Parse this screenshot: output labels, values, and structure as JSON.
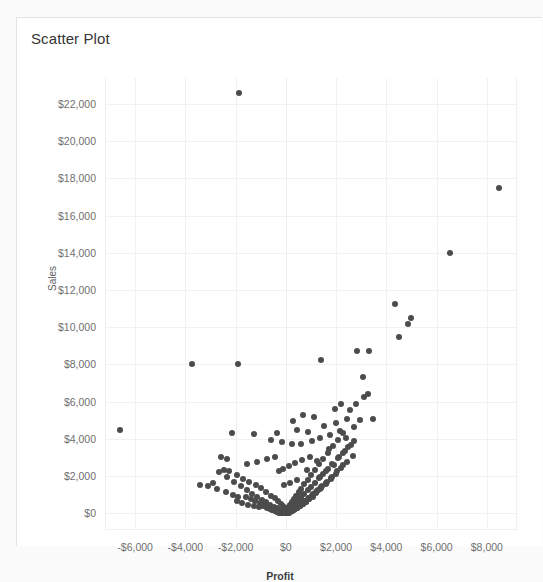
{
  "page": {
    "background_color": "#fbfbfb",
    "ghost_header_text": ""
  },
  "card": {
    "title": "Scatter Plot",
    "background_color": "#ffffff",
    "border_color": "#e4e4e4"
  },
  "chart_data": {
    "type": "scatter",
    "title": "Scatter Plot",
    "xlabel": "Profit",
    "ylabel": "Sales",
    "xlim": [
      -7200,
      9200
    ],
    "ylim": [
      -900,
      23400
    ],
    "xticks": [
      -6000,
      -4000,
      -2000,
      0,
      2000,
      4000,
      6000,
      8000
    ],
    "xticklabels": [
      "-$6,000",
      "-$4,000",
      "-$2,000",
      "$0",
      "$2,000",
      "$4,000",
      "$6,000",
      "$8,000"
    ],
    "yticks": [
      0,
      2000,
      4000,
      6000,
      8000,
      10000,
      12000,
      14000,
      16000,
      18000,
      20000,
      22000
    ],
    "yticklabels": [
      "$0",
      "$2,000",
      "$4,000",
      "$6,000",
      "$8,000",
      "$10,000",
      "$12,000",
      "$14,000",
      "$16,000",
      "$18,000",
      "$20,000",
      "$22,000"
    ],
    "grid": true,
    "legend": false,
    "marker_color": "#4c4c4c",
    "marker_size": 6,
    "series": [
      {
        "name": "Orders",
        "points": [
          [
            -1850,
            22600
          ],
          [
            8500,
            17500
          ],
          [
            6550,
            14000
          ],
          [
            4350,
            11250
          ],
          [
            4980,
            10500
          ],
          [
            4850,
            10150
          ],
          [
            4500,
            9450
          ],
          [
            3300,
            8750
          ],
          [
            2850,
            8700
          ],
          [
            1400,
            8250
          ],
          [
            -1900,
            8050
          ],
          [
            -3750,
            8000
          ],
          [
            3050,
            7300
          ],
          [
            3250,
            6400
          ],
          [
            2200,
            5850
          ],
          [
            1950,
            5600
          ],
          [
            700,
            5300
          ],
          [
            1100,
            5150
          ],
          [
            300,
            4950
          ],
          [
            -6600,
            4500
          ],
          [
            -2150,
            4300
          ],
          [
            -1250,
            4250
          ],
          [
            -350,
            4300
          ],
          [
            450,
            4500
          ],
          [
            900,
            4350
          ],
          [
            1500,
            4700
          ],
          [
            2000,
            4850
          ],
          [
            2450,
            5050
          ],
          [
            -600,
            3950
          ],
          [
            -150,
            3850
          ],
          [
            250,
            3700
          ],
          [
            600,
            3750
          ],
          [
            1050,
            3900
          ],
          [
            1350,
            4050
          ],
          [
            1750,
            4200
          ],
          [
            2150,
            4400
          ],
          [
            -2450,
            2350
          ],
          [
            -2250,
            2250
          ],
          [
            -2650,
            2200
          ],
          [
            -1950,
            2050
          ],
          [
            -1700,
            1850
          ],
          [
            -1450,
            1700
          ],
          [
            -1200,
            1500
          ],
          [
            -1000,
            1350
          ],
          [
            -800,
            1150
          ],
          [
            -600,
            950
          ],
          [
            -430,
            800
          ],
          [
            -300,
            650
          ],
          [
            -200,
            520
          ],
          [
            -120,
            400
          ],
          [
            -60,
            300
          ],
          [
            -20,
            200
          ],
          [
            0,
            120
          ],
          [
            20,
            180
          ],
          [
            60,
            260
          ],
          [
            110,
            360
          ],
          [
            170,
            470
          ],
          [
            240,
            600
          ],
          [
            320,
            760
          ],
          [
            410,
            930
          ],
          [
            510,
            1120
          ],
          [
            620,
            1330
          ],
          [
            740,
            1560
          ],
          [
            870,
            1800
          ],
          [
            1010,
            2060
          ],
          [
            1160,
            2340
          ],
          [
            1320,
            2630
          ],
          [
            1490,
            2940
          ],
          [
            1670,
            3260
          ],
          [
            1860,
            3600
          ],
          [
            2060,
            3950
          ],
          [
            2270,
            4320
          ],
          [
            -2350,
            1950
          ],
          [
            -2050,
            1700
          ],
          [
            -1800,
            1450
          ],
          [
            -1550,
            1250
          ],
          [
            -1350,
            1050
          ],
          [
            -1150,
            880
          ],
          [
            -950,
            720
          ],
          [
            -780,
            580
          ],
          [
            -620,
            460
          ],
          [
            -480,
            360
          ],
          [
            -360,
            270
          ],
          [
            -260,
            200
          ],
          [
            -180,
            140
          ],
          [
            -110,
            95
          ],
          [
            -55,
            60
          ],
          [
            -15,
            35
          ],
          [
            15,
            60
          ],
          [
            55,
            110
          ],
          [
            105,
            175
          ],
          [
            165,
            255
          ],
          [
            235,
            350
          ],
          [
            315,
            460
          ],
          [
            405,
            585
          ],
          [
            505,
            725
          ],
          [
            615,
            880
          ],
          [
            735,
            1050
          ],
          [
            865,
            1235
          ],
          [
            1005,
            1435
          ],
          [
            1155,
            1650
          ],
          [
            1315,
            1880
          ],
          [
            1485,
            2125
          ],
          [
            1665,
            2385
          ],
          [
            1855,
            2660
          ],
          [
            2055,
            2950
          ],
          [
            2265,
            3255
          ],
          [
            2485,
            3575
          ],
          [
            2715,
            3910
          ],
          [
            -1600,
            900
          ],
          [
            -1400,
            760
          ],
          [
            -1220,
            640
          ],
          [
            -1050,
            530
          ],
          [
            -890,
            435
          ],
          [
            -740,
            350
          ],
          [
            -600,
            275
          ],
          [
            -470,
            210
          ],
          [
            -350,
            155
          ],
          [
            -240,
            110
          ],
          [
            -140,
            75
          ],
          [
            -50,
            45
          ],
          [
            40,
            50
          ],
          [
            130,
            90
          ],
          [
            230,
            150
          ],
          [
            340,
            230
          ],
          [
            460,
            330
          ],
          [
            590,
            450
          ],
          [
            730,
            590
          ],
          [
            880,
            750
          ],
          [
            1040,
            930
          ],
          [
            1210,
            1130
          ],
          [
            1390,
            1350
          ],
          [
            1580,
            1590
          ],
          [
            1780,
            1850
          ],
          [
            1990,
            2130
          ],
          [
            2210,
            2430
          ],
          [
            2440,
            2750
          ],
          [
            2680,
            3090
          ],
          [
            -900,
            380
          ],
          [
            -760,
            300
          ],
          [
            -630,
            230
          ],
          [
            -510,
            170
          ],
          [
            -400,
            120
          ],
          [
            -300,
            80
          ],
          [
            -210,
            50
          ],
          [
            -130,
            30
          ],
          [
            -60,
            20
          ],
          [
            10,
            25
          ],
          [
            90,
            55
          ],
          [
            180,
            105
          ],
          [
            280,
            175
          ],
          [
            390,
            265
          ],
          [
            510,
            375
          ],
          [
            640,
            505
          ],
          [
            780,
            655
          ],
          [
            930,
            825
          ],
          [
            1090,
            1015
          ],
          [
            1260,
            1225
          ],
          [
            1440,
            1455
          ],
          [
            1630,
            1705
          ],
          [
            1830,
            1975
          ],
          [
            2040,
            2265
          ],
          [
            2260,
            2575
          ],
          [
            -540,
            155
          ],
          [
            -440,
            110
          ],
          [
            -350,
            75
          ],
          [
            -270,
            48
          ],
          [
            -195,
            28
          ],
          [
            -130,
            15
          ],
          [
            -70,
            8
          ],
          [
            -20,
            5
          ],
          [
            30,
            12
          ],
          [
            90,
            35
          ],
          [
            160,
            72
          ],
          [
            240,
            125
          ],
          [
            330,
            195
          ],
          [
            430,
            280
          ],
          [
            540,
            385
          ],
          [
            660,
            505
          ],
          [
            790,
            645
          ],
          [
            930,
            805
          ],
          [
            1080,
            980
          ],
          [
            1240,
            1175
          ],
          [
            1410,
            1390
          ],
          [
            1590,
            1620
          ],
          [
            1780,
            1870
          ],
          [
            -320,
            60
          ],
          [
            -255,
            40
          ],
          [
            -195,
            25
          ],
          [
            -140,
            14
          ],
          [
            -90,
            7
          ],
          [
            -45,
            3
          ],
          [
            5,
            4
          ],
          [
            50,
            15
          ],
          [
            105,
            40
          ],
          [
            170,
            80
          ],
          [
            245,
            135
          ],
          [
            330,
            205
          ],
          [
            425,
            290
          ],
          [
            530,
            390
          ],
          [
            645,
            505
          ],
          [
            770,
            635
          ],
          [
            905,
            780
          ],
          [
            1050,
            940
          ],
          [
            1205,
            1115
          ],
          [
            1370,
            1305
          ],
          [
            -180,
            22
          ],
          [
            -135,
            12
          ],
          [
            -95,
            6
          ],
          [
            -60,
            3
          ],
          [
            -28,
            1
          ],
          [
            0,
            2
          ],
          [
            35,
            10
          ],
          [
            80,
            28
          ],
          [
            135,
            58
          ],
          [
            200,
            100
          ],
          [
            275,
            155
          ],
          [
            360,
            222
          ],
          [
            455,
            302
          ],
          [
            560,
            395
          ],
          [
            675,
            500
          ],
          [
            800,
            618
          ],
          [
            935,
            748
          ],
          [
            1080,
            890
          ],
          [
            -95,
            8
          ],
          [
            -65,
            4
          ],
          [
            -38,
            2
          ],
          [
            -15,
            1
          ],
          [
            10,
            3
          ],
          [
            45,
            14
          ],
          [
            90,
            35
          ],
          [
            145,
            68
          ],
          [
            210,
            112
          ],
          [
            285,
            168
          ],
          [
            370,
            235
          ],
          [
            465,
            315
          ],
          [
            570,
            405
          ],
          [
            685,
            508
          ],
          [
            810,
            622
          ],
          [
            -2900,
            1650
          ],
          [
            -3100,
            1450
          ],
          [
            -2750,
            1280
          ],
          [
            -2400,
            1150
          ],
          [
            -2100,
            1000
          ],
          [
            -1900,
            880
          ],
          [
            -3400,
            1500
          ],
          [
            -2600,
            3050
          ],
          [
            -2350,
            2900
          ],
          [
            -1550,
            2650
          ],
          [
            -1150,
            2750
          ],
          [
            -750,
            2900
          ],
          [
            -420,
            3050
          ],
          [
            2550,
            5550
          ],
          [
            2800,
            5900
          ],
          [
            3100,
            6250
          ],
          [
            2700,
            4650
          ],
          [
            2950,
            5000
          ],
          [
            1700,
            3450
          ],
          [
            1250,
            2800
          ],
          [
            850,
            2350
          ],
          [
            3450,
            5050
          ],
          [
            2400,
            4050
          ],
          [
            -280,
            2250
          ],
          [
            -130,
            2400
          ],
          [
            120,
            2550
          ],
          [
            380,
            2700
          ],
          [
            660,
            2850
          ],
          [
            950,
            3000
          ],
          [
            -60,
            1500
          ],
          [
            180,
            1650
          ],
          [
            440,
            1800
          ],
          [
            -1950,
            680
          ],
          [
            -1750,
            560
          ],
          [
            -1500,
            460
          ],
          [
            -1280,
            380
          ],
          [
            -1080,
            310
          ],
          [
            2100,
            3050
          ],
          [
            2350,
            3350
          ],
          [
            2600,
            3650
          ],
          [
            1900,
            2600
          ],
          [
            1600,
            2250
          ],
          [
            1350,
            1950
          ]
        ]
      }
    ]
  }
}
